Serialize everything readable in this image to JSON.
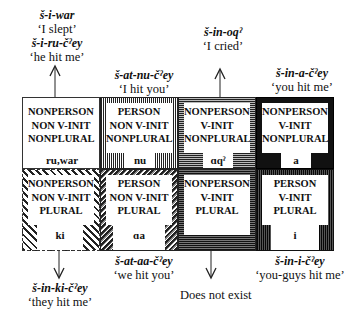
{
  "top_labels": [
    {
      "form": "š-i-war",
      "gloss": "'I slept'"
    },
    {
      "form": "š-i-ru-č<sup>ʔ</sup>ey",
      "gloss": "'he hit me'"
    }
  ],
  "labels": {
    "i_slept_form": "š-i-war",
    "i_slept_gloss": "‘I slept’",
    "he_hit_me_form": "š-i-ru-čˀey",
    "he_hit_me_gloss": "‘he hit me’",
    "i_hit_you_form": "š-at-nu-čˀey",
    "i_hit_you_gloss": "‘I hit you’",
    "i_cried_form": "š-in-oqˀ",
    "i_cried_gloss": "‘I cried’",
    "you_hit_me_form": "š-in-a-čˀey",
    "you_hit_me_gloss": "‘you hit me’",
    "they_hit_me_form": "š-in-ki-čˀey",
    "they_hit_me_gloss": "‘they hit me’",
    "we_hit_you_form": "š-at-ɑa-čˀey",
    "we_hit_you_gloss": "‘we hit you’",
    "does_not_exist": "Does not exist",
    "youguys_hit_me_form": "š-in-i-čˀey",
    "youguys_hit_me_gloss": "‘you-guys hit me’"
  },
  "cells": [
    {
      "l1": "NONPERSON",
      "l2": "NON V-INIT",
      "l3": "NONPLURAL",
      "morph": "ru,war"
    },
    {
      "l1": "PERSON",
      "l2": "NON V-INIT",
      "l3": "NONPLURAL",
      "morph": "nu"
    },
    {
      "l1": "NONPERSON",
      "l2": "V-INIT",
      "l3": "NONPLURAL",
      "morph": "ɑqˀ"
    },
    {
      "l1": "NONPERSON",
      "l2": "V-INIT",
      "l3": "NONPLURAL",
      "morph": "a"
    },
    {
      "l1": "NONPERSON",
      "l2": "NON V-INIT",
      "l3": "PLURAL",
      "morph": "ki"
    },
    {
      "l1": "PERSON",
      "l2": "NON V-INIT",
      "l3": "PLURAL",
      "morph": "ɑa"
    },
    {
      "l1": "NONPERSON",
      "l2": "V-INIT",
      "l3": "PLURAL",
      "morph": ""
    },
    {
      "l1": "PERSON",
      "l2": "V-INIT",
      "l3": "PLURAL",
      "morph": "i"
    }
  ]
}
